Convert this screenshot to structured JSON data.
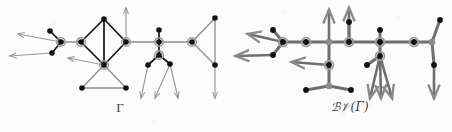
{
  "figure": {
    "type": "diagram",
    "background_color": "#fdfdfd"
  },
  "captions": {
    "left": "Γ",
    "right_script_b": "ℬ",
    "right_script_v": "𝒱",
    "right_paren_open": "(",
    "right_gamma": "Γ",
    "right_paren_close": ")",
    "right_full": "ℬ𝒱(Γ)"
  },
  "colors": {
    "vertex_fill": "#111111",
    "ring_stroke": "#9a9a9a",
    "edge_black": "#151515",
    "edge_gray": "#8d8d8d",
    "edge_gray_dark": "#6f6f6f",
    "arrow_gray": "#9b9b9b",
    "caption_text": "#3a3a3a",
    "page_background": "#fdfdfd"
  },
  "legend": {
    "plain_vertex": "black filled disc",
    "ringed_vertex": "black disc with gray halo ring",
    "gray_vertex": "solid gray disc",
    "ray": "gray line ending in arrowhead"
  },
  "graph_left": {
    "name": "Γ",
    "vertices": [
      {
        "id": "a1",
        "x": 50,
        "y": 31,
        "kind": "plain"
      },
      {
        "id": "a2",
        "x": 52,
        "y": 53,
        "kind": "plain"
      },
      {
        "id": "a3",
        "x": 61,
        "y": 42,
        "kind": "ringed"
      },
      {
        "id": "a4",
        "x": 81,
        "y": 42,
        "kind": "ringed"
      },
      {
        "id": "a5",
        "x": 104,
        "y": 19,
        "kind": "plain"
      },
      {
        "id": "a6",
        "x": 104,
        "y": 65,
        "kind": "ringed"
      },
      {
        "id": "a7",
        "x": 126,
        "y": 42,
        "kind": "ringed"
      },
      {
        "id": "a8",
        "x": 82,
        "y": 88,
        "kind": "plain"
      },
      {
        "id": "a9",
        "x": 126,
        "y": 88,
        "kind": "plain"
      },
      {
        "id": "b1",
        "x": 159,
        "y": 42,
        "kind": "ringed"
      },
      {
        "id": "b2",
        "x": 159,
        "y": 30,
        "kind": "plain"
      },
      {
        "id": "b3",
        "x": 159,
        "y": 55,
        "kind": "ringed"
      },
      {
        "id": "b4",
        "x": 148,
        "y": 65,
        "kind": "plain"
      },
      {
        "id": "b5",
        "x": 170,
        "y": 64,
        "kind": "plain"
      },
      {
        "id": "c1",
        "x": 192,
        "y": 42,
        "kind": "ringed"
      },
      {
        "id": "c2",
        "x": 215,
        "y": 18,
        "kind": "plain"
      },
      {
        "id": "c3",
        "x": 215,
        "y": 65,
        "kind": "plain"
      }
    ],
    "edges": [
      {
        "from": "a3",
        "to": "a1",
        "style": "black"
      },
      {
        "from": "a3",
        "to": "a2",
        "style": "black"
      },
      {
        "from": "a3",
        "to": "a4",
        "style": "gray"
      },
      {
        "from": "a4",
        "to": "a5",
        "style": "black"
      },
      {
        "from": "a4",
        "to": "a6",
        "style": "black"
      },
      {
        "from": "a5",
        "to": "a7",
        "style": "black"
      },
      {
        "from": "a6",
        "to": "a7",
        "style": "black"
      },
      {
        "from": "a5",
        "to": "a6",
        "style": "black"
      },
      {
        "from": "a6",
        "to": "a8",
        "style": "gray"
      },
      {
        "from": "a6",
        "to": "a9",
        "style": "gray"
      },
      {
        "from": "a8",
        "to": "a9",
        "style": "gray"
      },
      {
        "from": "a7",
        "to": "b1",
        "style": "gray"
      },
      {
        "from": "b1",
        "to": "b2",
        "style": "black"
      },
      {
        "from": "b1",
        "to": "b3",
        "style": "black"
      },
      {
        "from": "b3",
        "to": "b4",
        "style": "black"
      },
      {
        "from": "b3",
        "to": "b5",
        "style": "black"
      },
      {
        "from": "b1",
        "to": "c1",
        "style": "gray"
      },
      {
        "from": "c1",
        "to": "c2",
        "style": "gray"
      },
      {
        "from": "c1",
        "to": "c3",
        "style": "gray"
      },
      {
        "from": "c2",
        "to": "c3",
        "style": "gray"
      }
    ],
    "rays": [
      {
        "from": "a3",
        "to_x": 18,
        "to_y": 34
      },
      {
        "from": "a2",
        "to_x": 10,
        "to_y": 56
      },
      {
        "from": "a6",
        "to_x": 68,
        "to_y": 58
      },
      {
        "from": "a7",
        "to_x": 126,
        "to_y": 8
      },
      {
        "from": "b4",
        "to_x": 141,
        "to_y": 98
      },
      {
        "from": "b5",
        "to_x": 155,
        "to_y": 98
      },
      {
        "from": "b5",
        "to_x": 178,
        "to_y": 98
      },
      {
        "from": "c3",
        "to_x": 215,
        "to_y": 98
      }
    ]
  },
  "graph_right": {
    "name": "ℬ𝒱(Γ)",
    "vertices": [
      {
        "id": "r_p1",
        "x": 273,
        "y": 30,
        "kind": "plain"
      },
      {
        "id": "r_p2",
        "x": 273,
        "y": 55,
        "kind": "plain"
      },
      {
        "id": "r_h1",
        "x": 283,
        "y": 42,
        "kind": "ringed"
      },
      {
        "id": "r_h2",
        "x": 306,
        "y": 42,
        "kind": "ringed"
      },
      {
        "id": "r_g1",
        "x": 329,
        "y": 42,
        "kind": "gray"
      },
      {
        "id": "r_h3",
        "x": 349,
        "y": 42,
        "kind": "ringed"
      },
      {
        "id": "r_h4",
        "x": 329,
        "y": 65,
        "kind": "ringed"
      },
      {
        "id": "r_g2",
        "x": 329,
        "y": 86,
        "kind": "gray"
      },
      {
        "id": "r_p3",
        "x": 306,
        "y": 90,
        "kind": "plain"
      },
      {
        "id": "r_p4",
        "x": 351,
        "y": 90,
        "kind": "plain"
      },
      {
        "id": "r_p5",
        "x": 349,
        "y": 22,
        "kind": "plain"
      },
      {
        "id": "r_h5",
        "x": 380,
        "y": 42,
        "kind": "ringed"
      },
      {
        "id": "r_h6",
        "x": 380,
        "y": 56,
        "kind": "ringed"
      },
      {
        "id": "r_p6",
        "x": 380,
        "y": 30,
        "kind": "plain"
      },
      {
        "id": "r_p7",
        "x": 367,
        "y": 65,
        "kind": "plain"
      },
      {
        "id": "r_h7",
        "x": 414,
        "y": 42,
        "kind": "ringed"
      },
      {
        "id": "r_g3",
        "x": 432,
        "y": 42,
        "kind": "gray"
      },
      {
        "id": "r_p8",
        "x": 440,
        "y": 20,
        "kind": "plain"
      },
      {
        "id": "r_p9",
        "x": 434,
        "y": 65,
        "kind": "plain"
      }
    ],
    "edges": [
      {
        "from": "r_h1",
        "to": "r_p1",
        "style": "thick"
      },
      {
        "from": "r_h1",
        "to": "r_p2",
        "style": "thick"
      },
      {
        "from": "r_h1",
        "to": "r_h2",
        "style": "thick"
      },
      {
        "from": "r_h2",
        "to": "r_g1",
        "style": "thick"
      },
      {
        "from": "r_g1",
        "to": "r_p5_col",
        "style": "thick"
      },
      {
        "from": "r_g1",
        "to": "r_h3",
        "style": "thick"
      },
      {
        "from": "r_g1",
        "to": "r_h4",
        "style": "thick"
      },
      {
        "from": "r_h4",
        "to": "r_g2",
        "style": "thick"
      },
      {
        "from": "r_g2",
        "to": "r_p3",
        "style": "thick"
      },
      {
        "from": "r_g2",
        "to": "r_p4",
        "style": "thick"
      },
      {
        "from": "r_h3",
        "to": "r_p5",
        "style": "thick"
      },
      {
        "from": "r_h3",
        "to": "r_h5",
        "style": "thick"
      },
      {
        "from": "r_h5",
        "to": "r_p6",
        "style": "thick"
      },
      {
        "from": "r_h5",
        "to": "r_h6",
        "style": "thick"
      },
      {
        "from": "r_h6",
        "to": "r_p7",
        "style": "thick"
      },
      {
        "from": "r_h5",
        "to": "r_h7",
        "style": "thick"
      },
      {
        "from": "r_h7",
        "to": "r_g3",
        "style": "thick"
      },
      {
        "from": "r_g3",
        "to": "r_p8",
        "style": "thick"
      },
      {
        "from": "r_g3",
        "to": "r_p9",
        "style": "thick"
      }
    ],
    "rays": [
      {
        "from": "r_h1",
        "to_x": 248,
        "to_y": 34
      },
      {
        "from": "r_p2",
        "to_x": 236,
        "to_y": 56
      },
      {
        "from": "r_h4",
        "to_x": 292,
        "to_y": 62
      },
      {
        "from": "r_g1",
        "to_x": 329,
        "to_y": 10
      },
      {
        "from": "r_h3",
        "to_x": 349,
        "to_y": 8
      },
      {
        "from": "r_h6",
        "to_x": 370,
        "to_y": 98
      },
      {
        "from": "r_h6",
        "to_x": 381,
        "to_y": 98
      },
      {
        "from": "r_h6",
        "to_x": 392,
        "to_y": 98
      },
      {
        "from": "r_p9",
        "to_x": 434,
        "to_y": 98
      }
    ]
  }
}
